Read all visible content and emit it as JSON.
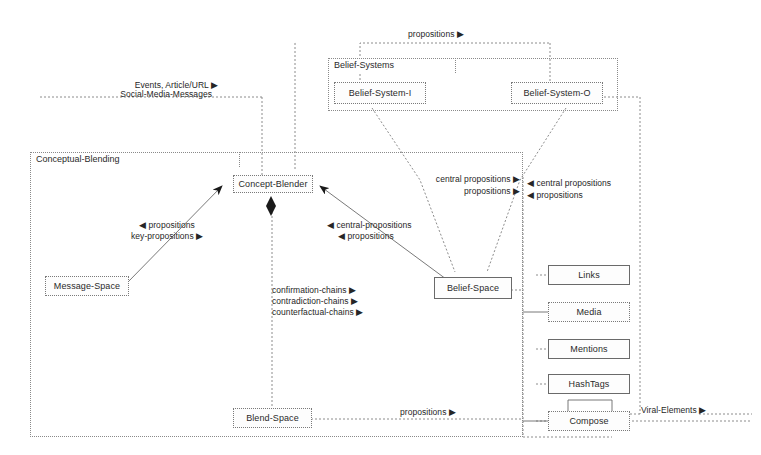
{
  "diagram": {
    "type": "uml-component-diagram",
    "packages": [
      {
        "id": "conceptual-blending",
        "label": "Conceptual-Blending"
      },
      {
        "id": "belief-systems",
        "label": "Belief-Systems"
      }
    ],
    "nodes": [
      {
        "id": "belief-system-i",
        "label": "Belief-System-I"
      },
      {
        "id": "belief-system-o",
        "label": "Belief-System-O"
      },
      {
        "id": "concept-blender",
        "label": "Concept-Blender"
      },
      {
        "id": "message-space",
        "label": "Message-Space"
      },
      {
        "id": "belief-space",
        "label": "Belief-Space"
      },
      {
        "id": "blend-space",
        "label": "Blend-Space"
      },
      {
        "id": "links",
        "label": "Links"
      },
      {
        "id": "media",
        "label": "Media"
      },
      {
        "id": "mentions",
        "label": "Mentions"
      },
      {
        "id": "hashtags",
        "label": "HashTags"
      },
      {
        "id": "compose",
        "label": "Compose"
      }
    ],
    "edge_labels": {
      "top_propositions": "propositions ▶",
      "events_article_url": "Events, Article/URL ▶",
      "social_media_messages": "Social-Media-Messages",
      "propositions_in": "◀ propositions",
      "key_propositions": "key-propositions ▶",
      "central_propositions_in": "◀ central-propositions",
      "propositions_in2": "◀ propositions",
      "central_propositions_out": "central propositions ▶",
      "propositions_out": "propositions ▶",
      "central_propositions_right": "◀ central propositions",
      "propositions_right": "◀ propositions",
      "confirmation_chains": "confirmation-chains ▶",
      "contradiction_chains": "contradiction-chains ▶",
      "counterfactual_chains": "counterfactual-chains ▶",
      "blend_propositions": "propositions ▶",
      "viral_elements": "Viral-Elements ▶"
    },
    "colors": {
      "line": "#6a6a6a",
      "dotted_line": "#8a8a8a",
      "text": "#262626",
      "background": "#ffffff",
      "node_fill": "#fdfdfd",
      "arrowhead": "#1a1a1a"
    }
  }
}
